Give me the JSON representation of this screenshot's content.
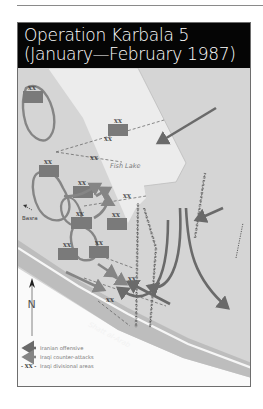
{
  "header": {
    "title_line1": "Operation Karbala 5",
    "title_line2": "(January—February 1987)"
  },
  "map": {
    "labels": {
      "fish_lake": "Fish Lake",
      "basra": "Basra",
      "shatt_al_arab": "Shatt al-Arab",
      "north": "N",
      "division_marker": "XX"
    },
    "colors": {
      "land": "#d5d5d5",
      "lake": "#ececec",
      "river_band": "#bdbdbd",
      "river_white": "#f6f6f6",
      "south_land": "#fafafa",
      "iraqi_unit": "#7a7a7a",
      "iranian_arrow": "#6a6a6a",
      "iraqi_arrow": "#858585",
      "header_bg": "#050505"
    }
  },
  "legend": {
    "items": [
      {
        "symbol": "dark-arrow",
        "label": "Iranian offensive"
      },
      {
        "symbol": "light-arrow",
        "label": "Iraqi counter-attacks"
      },
      {
        "symbol": "- XX -",
        "label": "Iraqi divisional areas"
      }
    ]
  }
}
